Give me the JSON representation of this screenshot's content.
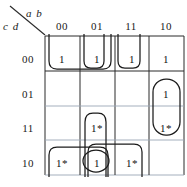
{
  "diagram": {
    "type": "karnaugh-map",
    "top_variables_label": "a b",
    "side_variables_label": "c d",
    "column_headers": [
      "00",
      "01",
      "11",
      "10"
    ],
    "row_headers": [
      "00",
      "01",
      "11",
      "10"
    ],
    "cells": [
      [
        "1",
        "1",
        "1",
        "1"
      ],
      [
        "",
        "",
        "",
        "1"
      ],
      [
        "",
        "1*",
        "",
        "1*"
      ],
      [
        "1*",
        "1",
        "1*",
        ""
      ]
    ],
    "colors": {
      "grid": "#2b2b2b",
      "grid_faint": "#9aa6b5",
      "loop": "#1c1c1c",
      "text": "#111111",
      "background": "#ffffff"
    },
    "groups": [
      {
        "name": "top-left-pair-wrap",
        "cells": [
          [
            0,
            0
          ],
          [
            0,
            1
          ]
        ],
        "shape": "open-top-rounded"
      },
      {
        "name": "top-col01-wrap",
        "cells": [
          [
            0,
            1
          ]
        ],
        "shape": "open-top-rounded"
      },
      {
        "name": "top-col11-wrap",
        "cells": [
          [
            0,
            2
          ]
        ],
        "shape": "open-top-rounded"
      },
      {
        "name": "right-col-pair",
        "cells": [
          [
            1,
            3
          ],
          [
            2,
            3
          ]
        ],
        "shape": "closed-rounded"
      },
      {
        "name": "col01-rows-11-10",
        "cells": [
          [
            2,
            1
          ],
          [
            3,
            1
          ]
        ],
        "shape": "open-bottom-rounded"
      },
      {
        "name": "single-cell-circle",
        "cells": [
          [
            3,
            1
          ]
        ],
        "shape": "ellipse"
      },
      {
        "name": "bottom-left-wrap",
        "cells": [
          [
            3,
            0
          ],
          [
            3,
            1
          ]
        ],
        "shape": "open-bottom-rounded"
      },
      {
        "name": "bottom-right-wrap",
        "cells": [
          [
            3,
            1
          ],
          [
            3,
            2
          ]
        ],
        "shape": "open-bottom-rounded"
      }
    ]
  }
}
